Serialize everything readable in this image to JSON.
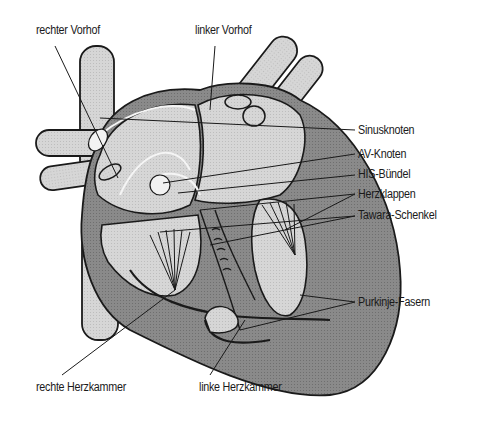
{
  "figure": {
    "labels": {
      "right_atrium": "rechter Vorhof",
      "left_atrium": "linker Vorhof",
      "sinus_node": "Sinusknoten",
      "av_node": "AV-Knoten",
      "his_bundle": "HIS-Bündel",
      "heart_valves": "Herzklappen",
      "tawara_branches": "Tawara-Schenkel",
      "purkinje_fibers": "Purkinje-Fasern",
      "right_ventricle": "rechte Herzkammer",
      "left_ventricle": "linke Herzkammer"
    },
    "colors": {
      "background": "#ffffff",
      "vessel_fill": "#cfcfcf",
      "chamber_fill": "#dcdcdc",
      "wall_fill": "#8f8f8f",
      "outline": "#1a1a1a",
      "conduction_highlight": "#f5f5f5"
    }
  }
}
